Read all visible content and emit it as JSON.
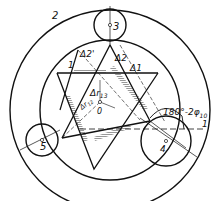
{
  "diagram": {
    "type": "technical-geometry",
    "colors": {
      "stroke": "#111111",
      "hatch": "#555555",
      "background": "#ffffff"
    },
    "labels": {
      "outer_ring": "2",
      "roller_top": "3",
      "roller_right": "4",
      "roller_left": "5",
      "member_1": "1",
      "delta_1": "Δ1",
      "delta_2": "Δ2",
      "delta_2_prime": "Δ2'",
      "delta_r13": "Δr",
      "delta_r13_sub": "13",
      "delta_r12": "Δr",
      "delta_r12_sub": "12",
      "center": "0",
      "angle": "180°-2φ",
      "angle_sub": "10",
      "axis_mark": "1"
    }
  }
}
